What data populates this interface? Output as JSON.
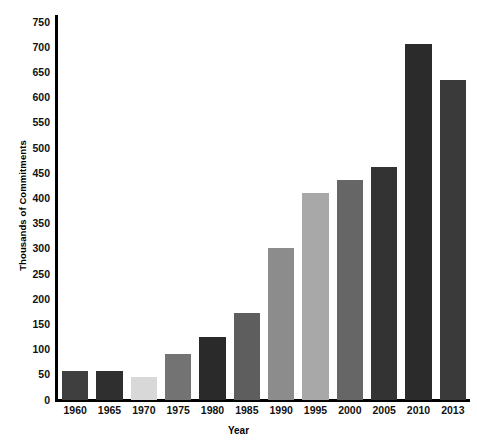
{
  "chart_data": {
    "type": "bar",
    "title": "",
    "xlabel": "Year",
    "ylabel": "Thousands of Commitments",
    "categories": [
      "1960",
      "1965",
      "1970",
      "1975",
      "1980",
      "1985",
      "1990",
      "1995",
      "2000",
      "2005",
      "2010",
      "2013"
    ],
    "values": [
      58,
      58,
      45,
      92,
      126,
      172,
      302,
      410,
      437,
      462,
      707,
      635
    ],
    "bar_colors": [
      "#3f3f3f",
      "#2f2f2f",
      "#d8d8d8",
      "#737373",
      "#2a2a2a",
      "#5e5e5e",
      "#8c8c8c",
      "#a8a8a8",
      "#666666",
      "#333333",
      "#2b2b2b",
      "#3a3a3a"
    ],
    "ylim": [
      0,
      750
    ],
    "ytick_step": 50,
    "ytick_labels": [
      "750",
      "700",
      "650",
      "600",
      "550",
      "500",
      "450",
      "400",
      "350",
      "300",
      "250",
      "200",
      "150",
      "100",
      "50",
      "0"
    ],
    "grid": false,
    "legend": false,
    "axis_color": "#000000",
    "background": "#ffffff"
  }
}
